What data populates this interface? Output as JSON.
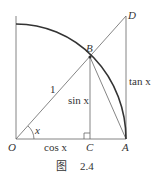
{
  "figure": {
    "caption_prefix": "图",
    "caption_number": "2.4"
  },
  "points": {
    "O": "O",
    "A": "A",
    "B": "B",
    "C": "C",
    "D": "D"
  },
  "labels": {
    "radius": "1",
    "sin": "sin x",
    "cos": "cos x",
    "tan": "tan x",
    "angle": "x"
  },
  "colors": {
    "line": "#555555",
    "arc": "#333333",
    "text": "#333333"
  }
}
